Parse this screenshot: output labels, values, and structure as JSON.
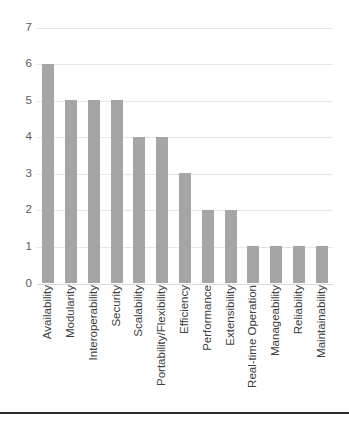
{
  "chart_data": {
    "type": "bar",
    "title": "",
    "xlabel": "",
    "ylabel": "",
    "ylim": [
      0,
      7
    ],
    "yticks": [
      7,
      6,
      5,
      4,
      3,
      2,
      1,
      0
    ],
    "grid": true,
    "legend": false,
    "orientation": "vertical",
    "bar_color": "#a5a5a5",
    "gridline_color": "#e6e6e6",
    "tick_label_color": "#595959",
    "category_label_color": "#404040",
    "category_label_rotation": "90",
    "categories": [
      "Availability",
      "Modularity",
      "Interoperability",
      "Security",
      "Scalability",
      "Portability/Flexibility",
      "Efficiency",
      "Performance",
      "Extensibility",
      "Real-time Operation",
      "Manageability",
      "Reliability",
      "Maintainability"
    ],
    "values": [
      6,
      5,
      5,
      5,
      4,
      4,
      3,
      2,
      2,
      1,
      1,
      1,
      1
    ]
  },
  "figure": {
    "bottom_rule_color": "#2b2b2b",
    "caption_fragment": ""
  }
}
